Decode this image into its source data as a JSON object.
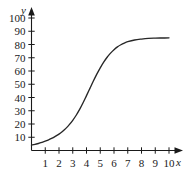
{
  "chart_data": {
    "type": "line",
    "title": "",
    "subtitle": "",
    "xlabel": "x",
    "ylabel": "y",
    "xlim": [
      0,
      10.6
    ],
    "ylim": [
      0,
      105
    ],
    "grid": false,
    "legend": null,
    "x_ticks": [
      1,
      2,
      3,
      4,
      5,
      6,
      7,
      8,
      9,
      10
    ],
    "x_tick_labels": [
      "1",
      "2",
      "3",
      "4",
      "5",
      "6",
      "7",
      "8",
      "9",
      "10"
    ],
    "y_ticks": [
      10,
      20,
      30,
      40,
      50,
      60,
      70,
      80,
      90,
      100
    ],
    "y_tick_labels": [
      "10",
      "20",
      "30",
      "40",
      "50",
      "60",
      "70",
      "80",
      "90",
      "100"
    ],
    "series": [
      {
        "name": "logistic curve",
        "color": "#262626",
        "x": [
          0,
          0.25,
          0.5,
          0.75,
          1,
          1.25,
          1.5,
          1.75,
          2,
          2.25,
          2.5,
          2.75,
          3,
          3.25,
          3.5,
          3.75,
          4,
          4.25,
          4.5,
          4.75,
          5,
          5.25,
          5.5,
          5.75,
          6,
          6.25,
          6.5,
          6.75,
          7,
          7.5,
          8,
          8.5,
          9,
          9.5,
          10
        ],
        "y": [
          4.1,
          4.6,
          5.3,
          6.1,
          7.0,
          8.1,
          9.3,
          10.8,
          12.4,
          14.4,
          16.7,
          19.5,
          22.8,
          26.6,
          31.0,
          36.0,
          41.4,
          46.9,
          52.4,
          57.6,
          62.4,
          66.7,
          70.4,
          73.5,
          76.1,
          78.2,
          79.8,
          81.1,
          82.1,
          83.4,
          84.1,
          84.6,
          84.8,
          84.9,
          85.0
        ]
      }
    ],
    "annotations": [],
    "axis_style": {
      "arrow_x": true,
      "arrow_y": true,
      "axis_color": "#1a1a1a",
      "tick_direction": "cross"
    }
  }
}
